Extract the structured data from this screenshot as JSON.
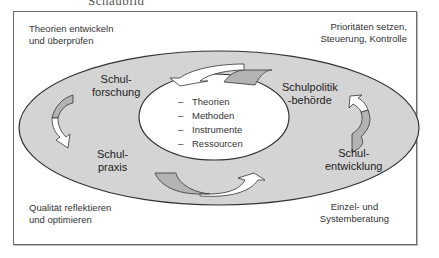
{
  "header_fragment": "Schaubild",
  "corners": {
    "top_left": [
      "Theorien entwickeln",
      "und überprüfen"
    ],
    "top_right": [
      "Prioritäten setzen,",
      "Steuerung, Kontrolle"
    ],
    "bottom_left": [
      "Qualität reflektieren",
      "und optimieren"
    ],
    "bottom_right": [
      "Einzel- und",
      "Systemberatung"
    ]
  },
  "nodes": {
    "schulforschung": [
      "Schul-",
      "forschung"
    ],
    "schulpolitik": [
      "Schulpolitik",
      "-behörde"
    ],
    "schulpraxis": [
      "Schul-",
      "praxis"
    ],
    "schulentwicklung": [
      "Schul-",
      "entwicklung"
    ]
  },
  "center": {
    "bullet": "–",
    "items": [
      "Theorien",
      "Methoden",
      "Instrumente",
      "Ressourcen"
    ]
  },
  "colors": {
    "outer_ellipse": "#d4d4d4",
    "arrow_dark": "#b3b3b3",
    "arrow_light": "#ffffff",
    "stroke": "#333333"
  }
}
